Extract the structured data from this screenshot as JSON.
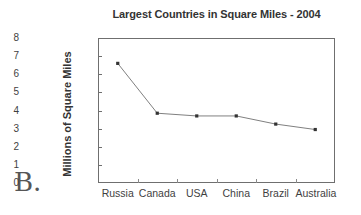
{
  "figure": {
    "label": "B."
  },
  "chart_data": {
    "type": "line",
    "title": "Largest Countries in Square Miles - 2004",
    "xlabel": "",
    "ylabel": "Millions of Square Miles",
    "categories": [
      "Russia",
      "Canada",
      "USA",
      "China",
      "Brazil",
      "Australia"
    ],
    "values": [
      6.6,
      3.85,
      3.7,
      3.7,
      3.25,
      2.95
    ],
    "ylim": [
      0,
      8
    ],
    "ytick_labels": [
      "8",
      "7",
      "6",
      "5",
      "4",
      "3",
      "2",
      "1",
      "0"
    ],
    "ytick_values": [
      8,
      7,
      6,
      5,
      4,
      3,
      2,
      1,
      0
    ],
    "grid": false,
    "legend": false,
    "legend_position": "none",
    "marker": "square",
    "line_color": "#808080",
    "marker_color": "#333333",
    "axis_color": "#6f6f6f"
  }
}
